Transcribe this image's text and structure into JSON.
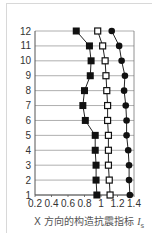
{
  "chart_data": {
    "type": "line",
    "title": "",
    "xlabel": "X 方向的构造抗震指标 Is",
    "ylabel": "",
    "xlim": [
      0.2,
      1.4
    ],
    "ylim": [
      1,
      12
    ],
    "x_ticks": [
      "0.2",
      "0.4",
      "0.6",
      "0.8",
      "1",
      "1.2",
      "1.4"
    ],
    "y_ticks": [
      "1",
      "2",
      "3",
      "4",
      "5",
      "6",
      "7",
      "8",
      "9",
      "10",
      "11",
      "12"
    ],
    "grid": "horizontal",
    "orientation": "values on x-axis, floor number on y-axis",
    "categories": [
      1,
      2,
      3,
      4,
      5,
      6,
      7,
      8,
      9,
      10,
      11,
      12
    ],
    "series": [
      {
        "name": "filled-square",
        "marker": "filled-square",
        "values": [
          0.95,
          0.94,
          0.94,
          0.93,
          0.93,
          0.81,
          0.78,
          0.8,
          0.87,
          0.88,
          0.86,
          0.7
        ]
      },
      {
        "name": "open-square",
        "marker": "open-square",
        "values": [
          1.11,
          1.1,
          1.09,
          1.09,
          1.09,
          1.08,
          1.08,
          1.07,
          1.06,
          1.05,
          1.02,
          0.96
        ]
      },
      {
        "name": "filled-circle",
        "marker": "filled-circle",
        "values": [
          1.35,
          1.34,
          1.34,
          1.33,
          1.31,
          1.31,
          1.3,
          1.28,
          1.29,
          1.25,
          1.22,
          1.13
        ]
      }
    ]
  },
  "axis_label": {
    "prefix": "X 方向的构造抗震指标 ",
    "symbol": "I",
    "subscript": "s"
  },
  "colors": {
    "line": "#222222",
    "grid": "#9a9a9a",
    "marker_fill": "#111111",
    "open_marker_fill": "#ffffff"
  }
}
